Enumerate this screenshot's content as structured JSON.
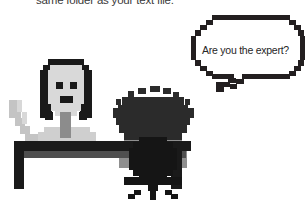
{
  "image": {
    "width": 305,
    "height": 202,
    "background_color": "#ffffff",
    "style": "pixel-art"
  },
  "caption": {
    "text": "same folder as your text file.",
    "color": "#3a3a3a",
    "clipped": "top"
  },
  "speech_bubble": {
    "text": "Are you the expert?",
    "border_color": "#231f20",
    "fill_color": "#ffffff",
    "text_color": "#262626",
    "tail_direction": "down-left"
  },
  "characters": [
    {
      "name": "standing-person",
      "hair_color": "#1a1a1a",
      "face_color": "#d9d9d9",
      "eye_color": "#1a1a1a",
      "mouth_color": "#1a1a1a",
      "neck_color": "#8c8c8c",
      "arm_color": "#c4c4c4",
      "position": "left"
    },
    {
      "name": "seated-person",
      "hair_color": "#2b2b2b",
      "hair_style": "curly",
      "body_color": "#8f8f8f",
      "position": "center"
    }
  ],
  "furniture": [
    {
      "name": "desk",
      "color": "#1a1a1a",
      "accent_color": "#555555"
    },
    {
      "name": "office-chair",
      "color": "#151515",
      "parts": [
        "backrest",
        "seat",
        "post",
        "legs"
      ]
    }
  ],
  "colors": {
    "black": "#1a1a1a",
    "dark_gray": "#2b2b2b",
    "mid_gray": "#8c8c8c",
    "light_gray": "#c4c4c4",
    "face_gray": "#d9d9d9",
    "white": "#ffffff"
  }
}
